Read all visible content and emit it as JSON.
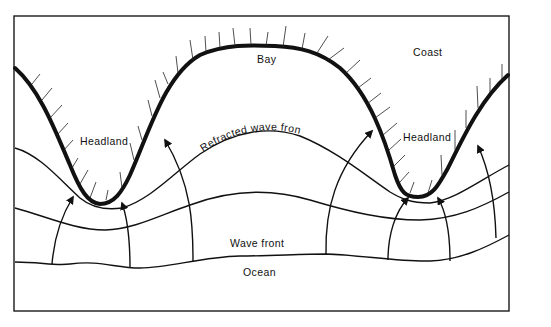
{
  "diagram": {
    "labels": {
      "coast": "Coast",
      "bay": "Bay",
      "headland_left": "Headland",
      "headland_right": "Headland",
      "refracted_wave_front": "Refracted wave front",
      "wave_front": "Wave front",
      "ocean": "Ocean"
    },
    "colors": {
      "line": "#111111",
      "background": "#ffffff"
    },
    "elements": {
      "coastline": "thick-curve-with-hatching",
      "wave_fronts": 4,
      "wave_rays_with_arrows": 4,
      "wave_rays_without_arrows": 4
    }
  }
}
